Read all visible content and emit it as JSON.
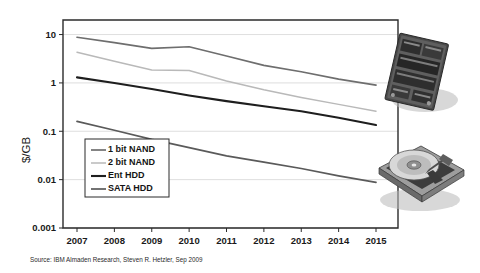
{
  "figure": {
    "source_note": "Source:  IBM Almaden Research, Steven R. Hetzler, Sep 2009",
    "ylabel": "$/GB"
  },
  "photos": [
    {
      "name": "ssd-photo",
      "caption": "solid state drive circuit board"
    },
    {
      "name": "hdd-photo",
      "caption": "hard disk drive with platter and actuator"
    }
  ],
  "chart_data": {
    "type": "line",
    "title": "",
    "xlabel": "",
    "ylabel": "$/GB",
    "yscale": "log",
    "ylim": [
      0.001,
      20
    ],
    "grid": true,
    "legend_position": "inside-lower-left",
    "categories": [
      "2007",
      "2008",
      "2009",
      "2010",
      "2011",
      "2012",
      "2013",
      "2014",
      "2015"
    ],
    "ytick_labels": [
      "10",
      "1",
      "0.1",
      "0.01",
      "0.001"
    ],
    "ytick_values": [
      10,
      1,
      0.1,
      0.01,
      0.001
    ],
    "series": [
      {
        "name": "1 bit NAND",
        "color": "#6e6e6e",
        "width": 1.7,
        "values": [
          8.8,
          6.8,
          5.2,
          5.6,
          3.6,
          2.3,
          1.7,
          1.2,
          0.9
        ]
      },
      {
        "name": "2 bit NAND",
        "color": "#b9b9b9",
        "width": 1.5,
        "values": [
          4.3,
          2.8,
          1.85,
          1.8,
          1.1,
          0.72,
          0.5,
          0.36,
          0.26
        ]
      },
      {
        "name": "Ent HDD",
        "color": "#1e1e1e",
        "width": 2.1,
        "values": [
          1.3,
          1.0,
          0.75,
          0.55,
          0.42,
          0.33,
          0.26,
          0.19,
          0.135
        ]
      },
      {
        "name": "SATA HDD",
        "color": "#5a5a5a",
        "width": 1.7,
        "values": [
          0.16,
          0.105,
          0.068,
          0.046,
          0.031,
          0.023,
          0.017,
          0.012,
          0.0088
        ]
      }
    ]
  }
}
